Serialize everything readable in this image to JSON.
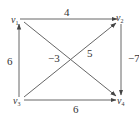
{
  "diagram": {
    "type": "directed-weighted-graph",
    "vertices": [
      {
        "id": "v1",
        "base": "v",
        "sub": "1"
      },
      {
        "id": "v2",
        "base": "v",
        "sub": "2"
      },
      {
        "id": "v3",
        "base": "v",
        "sub": "3"
      },
      {
        "id": "v4",
        "base": "v",
        "sub": "4"
      }
    ],
    "edges": [
      {
        "from": "v1",
        "to": "v2",
        "weight": "4"
      },
      {
        "from": "v3",
        "to": "v1",
        "weight": "6"
      },
      {
        "from": "v3",
        "to": "v2",
        "weight": "5"
      },
      {
        "from": "v1",
        "to": "v4",
        "weight": "−3"
      },
      {
        "from": "v2",
        "to": "v4",
        "weight": "−7"
      },
      {
        "from": "v3",
        "to": "v4",
        "weight": "6"
      }
    ],
    "colors": {
      "line": "#555555",
      "text": "#333333",
      "background": "#ffffff"
    }
  }
}
